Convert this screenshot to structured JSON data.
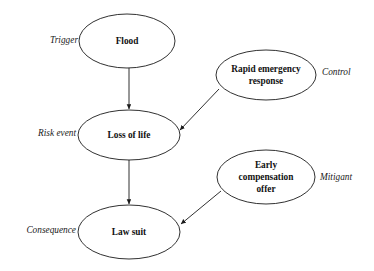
{
  "diagram": {
    "background_color": "#ffffff",
    "stroke_color": "#1a1a1a",
    "text_color": "#111111",
    "nodes": [
      {
        "id": "flood",
        "label": "Flood",
        "lines": [
          "Flood"
        ],
        "cx": 127,
        "cy": 41,
        "rx": 48,
        "ry": 27
      },
      {
        "id": "rapid-emergency-response",
        "label": "Rapid emergency response",
        "lines": [
          "Rapid emergency",
          "response"
        ],
        "cx": 266,
        "cy": 75,
        "rx": 50,
        "ry": 25
      },
      {
        "id": "loss-of-life",
        "label": "Loss of life",
        "lines": [
          "Loss of life"
        ],
        "cx": 129,
        "cy": 135,
        "rx": 51,
        "ry": 25
      },
      {
        "id": "early-compensation-offer",
        "label": "Early compensation offer",
        "lines": [
          "Early",
          "compensation",
          "offer"
        ],
        "cx": 266,
        "cy": 177,
        "rx": 49,
        "ry": 27
      },
      {
        "id": "law-suit",
        "label": "Law suit",
        "lines": [
          "Law suit"
        ],
        "cx": 129,
        "cy": 232,
        "rx": 51,
        "ry": 27
      }
    ],
    "side_labels": [
      {
        "id": "trigger",
        "text": "Trigger",
        "x": 78,
        "y": 41,
        "align": "right"
      },
      {
        "id": "control",
        "text": "Control",
        "x": 322,
        "y": 73,
        "align": "left"
      },
      {
        "id": "risk-event",
        "text": "Risk event",
        "x": 76,
        "y": 134,
        "align": "right"
      },
      {
        "id": "mitigant",
        "text": "Mitigant",
        "x": 320,
        "y": 178,
        "align": "left"
      },
      {
        "id": "consequence",
        "text": "Consequence",
        "x": 76,
        "y": 231,
        "align": "right"
      }
    ],
    "edges": [
      {
        "id": "flood-to-loss-of-life",
        "from": "flood",
        "to": "loss-of-life",
        "x1": 129,
        "y1": 68,
        "x2": 129,
        "y2": 109
      },
      {
        "id": "loss-of-life-to-law-suit",
        "from": "loss-of-life",
        "to": "law-suit",
        "x1": 129,
        "y1": 160,
        "x2": 129,
        "y2": 204
      },
      {
        "id": "response-to-loss-of-life",
        "from": "rapid-emergency-response",
        "to": "loss-of-life",
        "x1": 219,
        "y1": 89,
        "x2": 180,
        "y2": 130
      },
      {
        "id": "compensation-to-law-suit",
        "from": "early-compensation-offer",
        "to": "law-suit",
        "x1": 221,
        "y1": 191,
        "x2": 181,
        "y2": 224
      }
    ]
  }
}
